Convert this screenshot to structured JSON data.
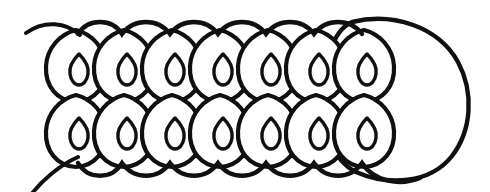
{
  "figure": {
    "title": "Hand-drawn line illustration of a cylindrical multicellular filament",
    "style": "black ink line drawing on white background",
    "background_color": "#ffffff",
    "ink_color": "#101010"
  },
  "canvas": {
    "width": 490,
    "height": 192
  },
  "structure": {
    "rows": 2,
    "cells_per_row": 7,
    "total_cells": 14,
    "has_nucleus_per_cell": true,
    "nucleus_shape": "teardrop",
    "cell_shape": "ovoid",
    "end_cap_count": 1,
    "end_cap_side": "right",
    "tail_count": 2,
    "tail_side": "left"
  },
  "geometry": {
    "cell_width": 52,
    "cell_height": 72,
    "row_pitch_x": 48,
    "first_cell_center_x": 76,
    "top_row_center_y": 66,
    "bottom_row_center_y": 131,
    "nucleus_width": 17,
    "nucleus_height": 26,
    "endcap_center_x": 418,
    "endcap_center_y": 97,
    "endcap_rx": 52,
    "endcap_ry": 76
  },
  "cells": {
    "top_row": [
      {
        "index": 1,
        "cx": 76,
        "cy": 66,
        "nucleus_cx": 79,
        "nucleus_cy": 67
      },
      {
        "index": 2,
        "cx": 124,
        "cy": 66,
        "nucleus_cx": 127,
        "nucleus_cy": 67
      },
      {
        "index": 3,
        "cx": 172,
        "cy": 66,
        "nucleus_cx": 175,
        "nucleus_cy": 67
      },
      {
        "index": 4,
        "cx": 220,
        "cy": 66,
        "nucleus_cx": 223,
        "nucleus_cy": 67
      },
      {
        "index": 5,
        "cx": 268,
        "cy": 66,
        "nucleus_cx": 271,
        "nucleus_cy": 67
      },
      {
        "index": 6,
        "cx": 316,
        "cy": 66,
        "nucleus_cx": 319,
        "nucleus_cy": 67
      },
      {
        "index": 7,
        "cx": 364,
        "cy": 66,
        "nucleus_cx": 367,
        "nucleus_cy": 67
      }
    ],
    "bottom_row": [
      {
        "index": 1,
        "cx": 76,
        "cy": 131,
        "nucleus_cx": 79,
        "nucleus_cy": 130
      },
      {
        "index": 2,
        "cx": 124,
        "cy": 131,
        "nucleus_cx": 127,
        "nucleus_cy": 130
      },
      {
        "index": 3,
        "cx": 172,
        "cy": 131,
        "nucleus_cx": 175,
        "nucleus_cy": 130
      },
      {
        "index": 4,
        "cx": 220,
        "cy": 131,
        "nucleus_cx": 223,
        "nucleus_cy": 130
      },
      {
        "index": 5,
        "cx": 268,
        "cy": 131,
        "nucleus_cx": 271,
        "nucleus_cy": 130
      },
      {
        "index": 6,
        "cx": 316,
        "cy": 131,
        "nucleus_cx": 319,
        "nucleus_cy": 130
      },
      {
        "index": 7,
        "cx": 364,
        "cy": 131,
        "nucleus_cx": 367,
        "nucleus_cy": 130
      }
    ]
  },
  "tails": {
    "upper": "M 26 33 C 44 20 66 22 82 36",
    "lower": "M 80 156 C 62 164 44 180 32 196"
  }
}
